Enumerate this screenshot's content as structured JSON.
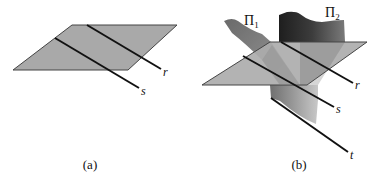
{
  "figure_a": {
    "caption": "(a)",
    "lines": [
      {
        "name": "r",
        "label": "r"
      },
      {
        "name": "s",
        "label": "s"
      }
    ],
    "plane_color": "#a9a9a9"
  },
  "figure_b": {
    "caption": "(b)",
    "surfaces": [
      {
        "name": "Pi1",
        "symbol": "Π",
        "subscript": "1"
      },
      {
        "name": "Pi2",
        "symbol": "Π",
        "subscript": "2"
      }
    ],
    "lines": [
      {
        "name": "r",
        "label": "r"
      },
      {
        "name": "s",
        "label": "s"
      },
      {
        "name": "t",
        "label": "t"
      }
    ],
    "plane_color": "#adadad"
  }
}
